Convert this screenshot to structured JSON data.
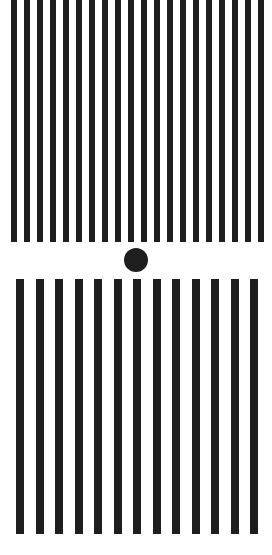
{
  "figure": {
    "colors": {
      "background": "#ffffff",
      "ink": "#1e1e1e"
    },
    "top_grating": {
      "count": 20,
      "start_x": 11,
      "pitch": 13,
      "bar_width": 6,
      "y_top": 0,
      "y_bottom": 242
    },
    "fixation_dot": {
      "cx": 136,
      "cy": 260,
      "r": 12
    },
    "bottom_grating": {
      "count": 13,
      "start_x": 16,
      "pitch": 19.5,
      "bar_width": 8,
      "y_top": 279,
      "y_bottom": 534
    }
  }
}
